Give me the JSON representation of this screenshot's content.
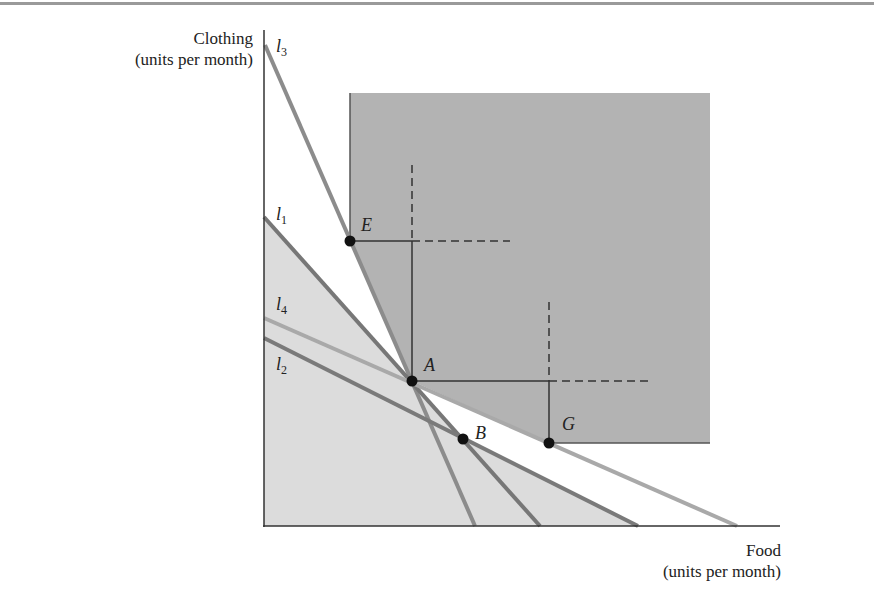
{
  "figure": {
    "y_axis_label": {
      "line1": "Clothing",
      "line2": "(units per month)"
    },
    "x_axis_label": {
      "line1": "Food",
      "line2": "(units per month)"
    },
    "lines": [
      {
        "id": "l3",
        "name": "l",
        "sub": "3",
        "from": [
          265,
          45
        ],
        "to": [
          475,
          526
        ],
        "color": "#8c8c8c"
      },
      {
        "id": "l1",
        "name": "l",
        "sub": "1",
        "from": [
          264,
          217
        ],
        "to": [
          540,
          526
        ],
        "color": "#777777"
      },
      {
        "id": "l4",
        "name": "l",
        "sub": "4",
        "from": [
          264,
          318
        ],
        "to": [
          737,
          526
        ],
        "color": "#a9a9a9"
      },
      {
        "id": "l2",
        "name": "l",
        "sub": "2",
        "from": [
          264,
          338
        ],
        "to": [
          638,
          526
        ],
        "color": "#7a7a7a"
      }
    ],
    "points": [
      {
        "id": "E",
        "label": "E",
        "x": 350,
        "y": 241
      },
      {
        "id": "A",
        "label": "A",
        "x": 412,
        "y": 381
      },
      {
        "id": "B",
        "label": "B",
        "x": 463,
        "y": 439
      },
      {
        "id": "G",
        "label": "G",
        "x": 549,
        "y": 443
      }
    ],
    "colors": {
      "preferred_region": "#b3b3b3",
      "budget_region": "#dcdcdc",
      "axis": "#333333",
      "point": "#111111"
    }
  }
}
